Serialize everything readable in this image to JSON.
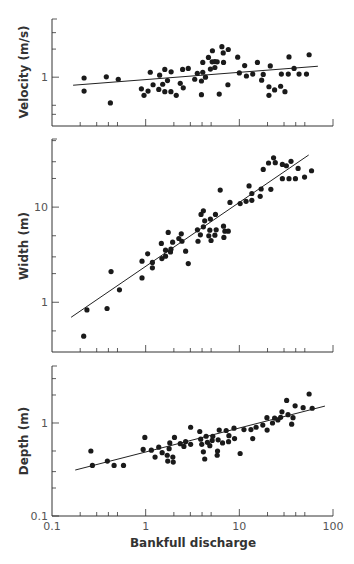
{
  "chart_data": {
    "type": "scatter",
    "x_scale": "log",
    "xlabel": "Bankfull discharge",
    "xlim": [
      0.1,
      100
    ],
    "x_ticks": [
      "0.1",
      "1",
      "10",
      "100"
    ],
    "x_tick_values": [
      0.1,
      1,
      10,
      100
    ],
    "x_minor_ticks": [
      0.2,
      0.3,
      0.4,
      0.5,
      2,
      3,
      4,
      5,
      20,
      30,
      40,
      50
    ],
    "panels": [
      {
        "name": "velocity",
        "ylabel": "Velocity (m/s)",
        "y_scale": "log",
        "ylim": [
          0.3,
          4.2
        ],
        "y_ticks": [
          "1"
        ],
        "y_tick_values": [
          1
        ],
        "y_minor_ticks": [
          0.4,
          0.5,
          2,
          3
        ],
        "show_x_tick_labels": false,
        "fit_line": {
          "x": [
            0.168,
            69
          ],
          "y": [
            0.82,
            1.31
          ]
        },
        "points": [
          [
            0.22,
            0.98
          ],
          [
            0.22,
            0.71
          ],
          [
            0.38,
            1.01
          ],
          [
            0.42,
            0.53
          ],
          [
            0.51,
            0.95
          ],
          [
            0.9,
            0.75
          ],
          [
            0.96,
            0.64
          ],
          [
            1.06,
            0.71
          ],
          [
            1.12,
            1.13
          ],
          [
            1.2,
            0.83
          ],
          [
            1.38,
            0.74
          ],
          [
            1.41,
            1.05
          ],
          [
            1.52,
            0.84
          ],
          [
            1.6,
            0.7
          ],
          [
            1.6,
            1.21
          ],
          [
            1.71,
            0.92
          ],
          [
            1.86,
            0.7
          ],
          [
            1.87,
            1.14
          ],
          [
            2.12,
            0.64
          ],
          [
            2.34,
            0.86
          ],
          [
            2.48,
            1.21
          ],
          [
            2.52,
            0.77
          ],
          [
            2.85,
            1.24
          ],
          [
            3.34,
            0.95
          ],
          [
            3.56,
            1.1
          ],
          [
            3.94,
            0.91
          ],
          [
            3.94,
            0.65
          ],
          [
            4.07,
            1.13
          ],
          [
            4.07,
            1.44
          ],
          [
            4.35,
            1.0
          ],
          [
            4.68,
            1.63
          ],
          [
            4.91,
            1.22
          ],
          [
            5.13,
            1.46
          ],
          [
            5.16,
            1.92
          ],
          [
            5.48,
            1.27
          ],
          [
            5.48,
            1.47
          ],
          [
            5.8,
            1.46
          ],
          [
            6.1,
            0.66
          ],
          [
            6.51,
            2.12
          ],
          [
            6.78,
            1.44
          ],
          [
            6.73,
            1.82
          ],
          [
            7.55,
            0.83
          ],
          [
            7.62,
            1.98
          ],
          [
            9.6,
            1.64
          ],
          [
            10.0,
            1.11
          ],
          [
            11.4,
            1.33
          ],
          [
            11.9,
            1.03
          ],
          [
            13.9,
            1.08
          ],
          [
            15.6,
            1.44
          ],
          [
            17.3,
            0.93
          ],
          [
            18.0,
            1.07
          ],
          [
            20.7,
            0.79
          ],
          [
            20.7,
            0.64
          ],
          [
            21.4,
            1.32
          ],
          [
            23.8,
            0.73
          ],
          [
            27.6,
            0.8
          ],
          [
            28.1,
            1.08
          ],
          [
            30.7,
            0.7
          ],
          [
            33.3,
            1.08
          ],
          [
            33.9,
            1.65
          ],
          [
            38.4,
            1.24
          ],
          [
            43.4,
            1.08
          ],
          [
            52.1,
            1.08
          ],
          [
            55.6,
            1.74
          ]
        ]
      },
      {
        "name": "width",
        "ylabel": "Width (m)",
        "y_scale": "log",
        "ylim": [
          0.3,
          52
        ],
        "y_ticks": [
          "1",
          "10"
        ],
        "y_tick_values": [
          1,
          10
        ],
        "y_minor_ticks": [
          0.5,
          2,
          3,
          5,
          20,
          30,
          50
        ],
        "show_x_tick_labels": false,
        "fit_line": {
          "x": [
            0.16,
            55
          ],
          "y": [
            0.695,
            35.3
          ]
        },
        "points": [
          [
            0.218,
            0.44
          ],
          [
            0.236,
            0.83
          ],
          [
            0.387,
            0.86
          ],
          [
            0.427,
            2.1
          ],
          [
            0.525,
            1.35
          ],
          [
            0.914,
            1.8
          ],
          [
            0.914,
            2.7
          ],
          [
            1.05,
            3.23
          ],
          [
            1.18,
            2.62
          ],
          [
            1.18,
            2.3
          ],
          [
            1.47,
            4.15
          ],
          [
            1.49,
            2.88
          ],
          [
            1.63,
            3.05
          ],
          [
            1.63,
            3.53
          ],
          [
            1.74,
            5.42
          ],
          [
            1.84,
            3.38
          ],
          [
            1.86,
            3.61
          ],
          [
            1.94,
            4.28
          ],
          [
            2.26,
            4.68
          ],
          [
            2.4,
            5.24
          ],
          [
            2.44,
            4.38
          ],
          [
            2.67,
            3.44
          ],
          [
            2.85,
            2.55
          ],
          [
            3.57,
            5.77
          ],
          [
            3.62,
            4.38
          ],
          [
            3.84,
            5.11
          ],
          [
            3.9,
            8.37
          ],
          [
            4.13,
            9.14
          ],
          [
            4.13,
            6.21
          ],
          [
            4.27,
            7.17
          ],
          [
            4.72,
            4.99
          ],
          [
            4.84,
            5.72
          ],
          [
            4.91,
            7.48
          ],
          [
            4.99,
            4.46
          ],
          [
            5.48,
            5.07
          ],
          [
            5.56,
            8.37
          ],
          [
            5.66,
            5.77
          ],
          [
            6.25,
            15.1
          ],
          [
            6.78,
            6.31
          ],
          [
            6.84,
            4.8
          ],
          [
            7.01,
            5.59
          ],
          [
            7.62,
            5.59
          ],
          [
            7.94,
            11.2
          ],
          [
            10.2,
            10.9
          ],
          [
            11.8,
            11.5
          ],
          [
            12.7,
            16.7
          ],
          [
            13.6,
            13.9
          ],
          [
            13.6,
            11.8
          ],
          [
            16.7,
            13.0
          ],
          [
            17.1,
            15.5
          ],
          [
            18.0,
            24.9
          ],
          [
            21.7,
            15.4
          ],
          [
            20.5,
            29.1
          ],
          [
            23.2,
            33.0
          ],
          [
            24.2,
            29.3
          ],
          [
            28.8,
            28.1
          ],
          [
            28.8,
            19.9
          ],
          [
            31.8,
            27.2
          ],
          [
            33.9,
            19.9
          ],
          [
            35.6,
            30.3
          ],
          [
            39.7,
            19.9
          ],
          [
            42.4,
            25.5
          ],
          [
            49.7,
            20.7
          ],
          [
            59.0,
            24.1
          ]
        ]
      },
      {
        "name": "depth",
        "ylabel": "Depth (m)",
        "y_scale": "log",
        "ylim": [
          0.1,
          4.1
        ],
        "y_ticks": [
          "0.1",
          "1"
        ],
        "y_tick_values": [
          0.1,
          1
        ],
        "y_minor_ticks": [
          0.2,
          0.3,
          0.5,
          2,
          3
        ],
        "show_x_tick_labels": true,
        "fit_line": {
          "x": [
            0.177,
            82
          ],
          "y": [
            0.312,
            1.52
          ]
        },
        "points": [
          [
            0.26,
            0.5
          ],
          [
            0.27,
            0.35
          ],
          [
            0.39,
            0.39
          ],
          [
            0.46,
            0.35
          ],
          [
            0.58,
            0.35
          ],
          [
            0.94,
            0.52
          ],
          [
            0.98,
            0.7
          ],
          [
            1.15,
            0.51
          ],
          [
            1.26,
            0.43
          ],
          [
            1.38,
            0.55
          ],
          [
            1.5,
            0.48
          ],
          [
            1.7,
            0.45
          ],
          [
            1.72,
            0.39
          ],
          [
            1.78,
            0.53
          ],
          [
            1.81,
            0.61
          ],
          [
            1.95,
            0.43
          ],
          [
            1.97,
            0.38
          ],
          [
            2.03,
            0.7
          ],
          [
            2.34,
            0.6
          ],
          [
            2.56,
            0.56
          ],
          [
            2.67,
            0.63
          ],
          [
            3.02,
            0.59
          ],
          [
            3.02,
            0.9
          ],
          [
            3.78,
            0.81
          ],
          [
            3.87,
            0.67
          ],
          [
            3.97,
            0.59
          ],
          [
            4.13,
            0.49
          ],
          [
            4.27,
            0.41
          ],
          [
            4.42,
            0.72
          ],
          [
            4.56,
            0.62
          ],
          [
            4.84,
            0.57
          ],
          [
            5.13,
            0.65
          ],
          [
            5.21,
            0.72
          ],
          [
            5.8,
            0.45
          ],
          [
            5.85,
            0.5
          ],
          [
            5.94,
            0.66
          ],
          [
            6.1,
            0.84
          ],
          [
            6.62,
            0.61
          ],
          [
            7.24,
            0.83
          ],
          [
            7.67,
            0.63
          ],
          [
            7.74,
            0.73
          ],
          [
            8.77,
            0.88
          ],
          [
            8.89,
            0.68
          ],
          [
            10.2,
            0.47
          ],
          [
            11.2,
            0.85
          ],
          [
            13.3,
            0.85
          ],
          [
            13.9,
            0.68
          ],
          [
            15.1,
            0.9
          ],
          [
            17.8,
            0.95
          ],
          [
            19.7,
            1.14
          ],
          [
            19.8,
            0.84
          ],
          [
            22.6,
            1.0
          ],
          [
            23.8,
            1.13
          ],
          [
            25.8,
            1.08
          ],
          [
            27.6,
            1.15
          ],
          [
            28.5,
            1.32
          ],
          [
            32.0,
            1.75
          ],
          [
            33.1,
            1.23
          ],
          [
            36.2,
            0.97
          ],
          [
            37.4,
            1.14
          ],
          [
            39.4,
            1.53
          ],
          [
            48.0,
            1.46
          ],
          [
            55.6,
            2.05
          ],
          [
            60.0,
            1.44
          ]
        ]
      }
    ]
  }
}
